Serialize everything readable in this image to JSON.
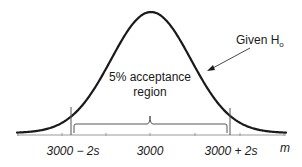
{
  "chart_data": {
    "type": "line",
    "title": "",
    "xlabel": "m",
    "ylabel": "",
    "x_ticks": [
      "3000 − 2s",
      "3000",
      "3000 + 2s"
    ],
    "curve": {
      "type": "normal",
      "mean": 3000,
      "std_label": "s"
    },
    "annotations": [
      {
        "text": "Given H",
        "subscript": "o",
        "points_to": "curve right flank"
      },
      {
        "text": "5% acceptance region",
        "position": "center under curve"
      }
    ],
    "region": {
      "from": "3000 − 2s",
      "to": "3000 + 2s",
      "marked_with": "bracket and vertical lines"
    },
    "grid": false,
    "legend": null
  },
  "labels": {
    "given_text": "Given H",
    "given_subscript": "o",
    "region_line1": "5% acceptance",
    "region_line2": "region",
    "tick_left": "3000 − 2s",
    "tick_center": "3000",
    "tick_right": "3000 + 2s",
    "axis_label": "m"
  },
  "colors": {
    "curve": "#1a1a1a",
    "axis": "#9a9a9a",
    "lines": "#555555",
    "background": "#ffffff"
  }
}
